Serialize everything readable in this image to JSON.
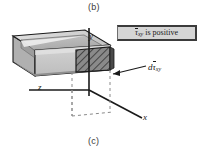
{
  "figure": {
    "part_label_top": "(b)",
    "part_label_bottom": "(c)",
    "legend": {
      "symbol_tau": "τ",
      "symbol_sub": "xy",
      "text_tail": " is positive",
      "full_text": "τ̄xy is positive",
      "box_fill": "#d5d5d5",
      "box_border": "#3b3b3b"
    },
    "callout": {
      "prefix": "d",
      "symbol_tau": "τ",
      "symbol_sub": "xy",
      "full_text": "dτ̄xy"
    },
    "axes": [
      {
        "name": "y",
        "label": "y",
        "direction": "vertical-up"
      },
      {
        "name": "z",
        "label": "z",
        "direction": "horizontal-left"
      },
      {
        "name": "x",
        "label": "x",
        "direction": "diagonal-down-right"
      }
    ],
    "colors": {
      "beam_top": "#d9d9d9",
      "beam_inner": "#b6b6b6",
      "beam_front": "#c9c9c9",
      "beam_side_dark": "#9a9a9a",
      "hatch_fill": "#8a8a8a",
      "hatch_line": "#1f1f1f",
      "outline": "#1a1a1a",
      "dashed": "#7a7a7a",
      "background": "#ffffff"
    }
  }
}
